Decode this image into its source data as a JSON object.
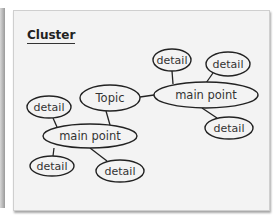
{
  "title": "Cluster",
  "colors": {
    "card_bg": "#f3f3f3",
    "stroke": "#222222",
    "text": "#333333"
  },
  "nodes": [
    {
      "id": "topic",
      "label": "Topic",
      "cx": 110,
      "cy": 98,
      "rx": 30,
      "ry": 13
    },
    {
      "id": "main1",
      "label": "main point",
      "cx": 206,
      "cy": 95,
      "rx": 52,
      "ry": 13
    },
    {
      "id": "main2",
      "label": "main point",
      "cx": 90,
      "cy": 136,
      "rx": 47,
      "ry": 12
    },
    {
      "id": "d1",
      "label": "detail",
      "cx": 172,
      "cy": 60,
      "rx": 19,
      "ry": 11
    },
    {
      "id": "d2",
      "label": "detail",
      "cx": 228,
      "cy": 64,
      "rx": 22,
      "ry": 12
    },
    {
      "id": "d3",
      "label": "detail",
      "cx": 229,
      "cy": 128,
      "rx": 24,
      "ry": 11
    },
    {
      "id": "d4",
      "label": "detail",
      "cx": 49,
      "cy": 107,
      "rx": 22,
      "ry": 11
    },
    {
      "id": "d5",
      "label": "detail",
      "cx": 52,
      "cy": 166,
      "rx": 22,
      "ry": 10
    },
    {
      "id": "d6",
      "label": "detail",
      "cx": 120,
      "cy": 171,
      "rx": 24,
      "ry": 11
    }
  ],
  "edges": [
    {
      "from": "topic",
      "to": "main1"
    },
    {
      "from": "topic",
      "to": "main2"
    },
    {
      "from": "main1",
      "to": "d1"
    },
    {
      "from": "main1",
      "to": "d2"
    },
    {
      "from": "main1",
      "to": "d3"
    },
    {
      "from": "main2",
      "to": "d4"
    },
    {
      "from": "main2",
      "to": "d5"
    },
    {
      "from": "main2",
      "to": "d6"
    }
  ]
}
